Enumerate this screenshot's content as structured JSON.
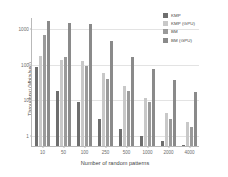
{
  "chart_data": {
    "type": "bar",
    "title": "",
    "xlabel": "Number of random patterns",
    "ylabel": "Throughput (Mbits/sec)",
    "categories": [
      "10",
      "50",
      "100",
      "250",
      "500",
      "1000",
      "2000",
      "4000"
    ],
    "yscale": "log",
    "ylim": [
      0.5,
      2000
    ],
    "yticks": [
      "1",
      "10",
      "100",
      "1000"
    ],
    "ytick_values": [
      1,
      10,
      100,
      1000
    ],
    "grid": true,
    "legend_position": "top-right",
    "series": [
      {
        "name": "KMP",
        "color": "#6e6e6e",
        "values": [
          80,
          17,
          8.5,
          2.8,
          1.5,
          0.95,
          0.68,
          0.55
        ]
      },
      {
        "name": "KMP (GPU)",
        "color": "#c8c8c8",
        "values": [
          160,
          130,
          115,
          56,
          24,
          11,
          4.3,
          2.3
        ]
      },
      {
        "name": "BM",
        "color": "#9a9a9a",
        "values": [
          620,
          155,
          84,
          38,
          17,
          8.5,
          2.9,
          1.7
        ]
      },
      {
        "name": "BM (GPU)",
        "color": "#8a8a8a",
        "values": [
          1500,
          1350,
          1250,
          420,
          150,
          72,
          35,
          16
        ]
      }
    ]
  }
}
